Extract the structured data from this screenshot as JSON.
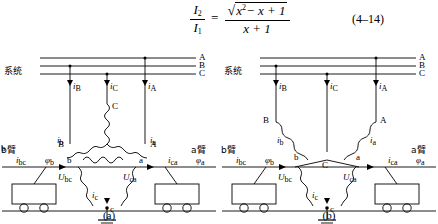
{
  "equation": {
    "lhs_num": "I",
    "lhs_num_sub": "2",
    "lhs_den": "I",
    "lhs_den_sub": "1",
    "equals": "=",
    "rhs_num_radicand": "x",
    "rhs_num_radicand_sup": "2",
    "rhs_num_rest": "− x + 1",
    "rhs_den": "x + 1",
    "number": "(4–14)"
  },
  "figures": [
    {
      "id": "a",
      "caption": "(a)",
      "system_label": "系统",
      "bus_labels": [
        "A",
        "B",
        "C"
      ],
      "line_currents": [
        "i",
        "i",
        "i"
      ],
      "line_current_subs": [
        "B",
        "C",
        "A"
      ],
      "primary_winding_labels": [
        "C",
        "B",
        "A"
      ],
      "secondary_node_labels": [
        "b",
        "a",
        "c"
      ],
      "voltage_labels": [
        {
          "symbol": "U",
          "sub": "bc"
        },
        {
          "symbol": "U",
          "sub": "ca"
        }
      ],
      "arm_labels": [
        "b臂",
        "a臂"
      ],
      "feeder_currents": [
        {
          "symbol": "i",
          "sub": "b"
        },
        {
          "symbol": "i",
          "sub": "a"
        },
        {
          "symbol": "i",
          "sub": "c"
        }
      ],
      "load_currents": [
        {
          "symbol": "i",
          "sub": "bc"
        },
        {
          "symbol": "i",
          "sub": "ca"
        }
      ],
      "phase_angles": [
        {
          "symbol": "φ",
          "sub": "b"
        },
        {
          "symbol": "φ",
          "sub": "a"
        }
      ],
      "ground_symbol": "earth-ground"
    },
    {
      "id": "b",
      "caption": "(b)",
      "system_label": "系统",
      "bus_labels": [
        "A",
        "B",
        "C"
      ],
      "line_currents": [
        "i",
        "i",
        "i"
      ],
      "line_current_subs": [
        "B",
        "C",
        "A"
      ],
      "primary_winding_labels": [
        "B",
        "A",
        "C"
      ],
      "secondary_node_labels": [
        "b",
        "a",
        "c"
      ],
      "voltage_labels": [
        {
          "symbol": "U",
          "sub": "bc"
        },
        {
          "symbol": "U",
          "sub": "ca"
        }
      ],
      "arm_labels": [
        "b臂",
        "a臂"
      ],
      "feeder_currents": [
        {
          "symbol": "i",
          "sub": "b"
        },
        {
          "symbol": "i",
          "sub": "a"
        },
        {
          "symbol": "i",
          "sub": "c"
        }
      ],
      "load_currents": [
        {
          "symbol": "i",
          "sub": "bc"
        },
        {
          "symbol": "i",
          "sub": "ca"
        }
      ],
      "phase_angles": [
        {
          "symbol": "φ",
          "sub": "b"
        },
        {
          "symbol": "φ",
          "sub": "a"
        }
      ],
      "ground_symbol": "earth-ground"
    }
  ],
  "colors": {
    "ink": "#000000",
    "background": "#ffffff"
  }
}
